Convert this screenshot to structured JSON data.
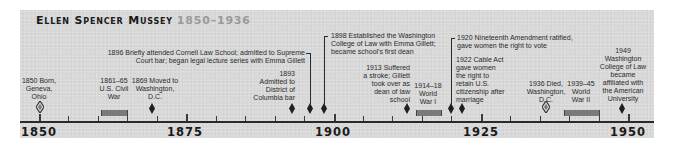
{
  "title": {
    "name": "Ellen Spencer Mussey",
    "years": "1850–1936"
  },
  "axis": {
    "start": 1850,
    "end": 1950,
    "major_labels": [
      "1850",
      "1875",
      "1900",
      "1925",
      "1950"
    ],
    "tick_interval": 5
  },
  "events": [
    {
      "year": "1850",
      "text": [
        "1850 Born,",
        "Geneva,",
        "Ohio"
      ],
      "marker": "open-diamond"
    },
    {
      "year": "1861–65",
      "text": [
        "1861–65",
        "U.S. Civil",
        "War"
      ],
      "marker": "period-bar"
    },
    {
      "year": "1869",
      "text": [
        "1869 Moved to",
        "Washington,",
        "D.C."
      ],
      "marker": "diamond"
    },
    {
      "year": "1893",
      "text": [
        "1893",
        "Admitted to",
        "District of",
        "Columbia bar"
      ],
      "marker": "diamond"
    },
    {
      "year": "1896",
      "text": [
        "1896 Briefly attended Cornell Law School; admitted to Supreme",
        "Court bar; began legal lecture series with Emma Gillett"
      ],
      "marker": "diamond"
    },
    {
      "year": "1898",
      "text": [
        "1898 Established the Washington",
        "College of Law with Emma Gillett;",
        "became school's first dean"
      ],
      "marker": "diamond"
    },
    {
      "year": "1913",
      "text": [
        "1913 Suffered",
        "a stroke; Gillett",
        "took over as",
        "dean of law",
        "school"
      ],
      "marker": "diamond"
    },
    {
      "year": "1914–18",
      "text": [
        "1914–18",
        "World",
        "War I"
      ],
      "marker": "period-bar"
    },
    {
      "year": "1920",
      "text": [
        "1920 Nineteenth Amendment ratified,",
        "gave women the right to vote"
      ],
      "marker": "diamond"
    },
    {
      "year": "1922",
      "text": [
        "1922 Cable Act",
        "gave women",
        "the right to",
        "retain U.S.",
        "citizenship after",
        "marriage"
      ],
      "marker": "diamond"
    },
    {
      "year": "1936",
      "text": [
        "1936 Died,",
        "Washington,",
        "D.C."
      ],
      "marker": "open-diamond"
    },
    {
      "year": "1939–45",
      "text": [
        "1939–45",
        "World",
        "War II"
      ],
      "marker": "period-bar"
    },
    {
      "year": "1949",
      "text": [
        "1949",
        "Washington",
        "College of Law",
        "became",
        "affiliated with",
        "the American",
        "University"
      ],
      "marker": "diamond"
    }
  ],
  "colors": {
    "panel": "#d9d9d9",
    "text": "#2b2b2b",
    "title_years": "#9a9a9a",
    "bar": "#7a7a7a"
  }
}
